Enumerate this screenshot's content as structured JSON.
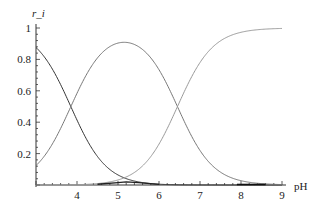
{
  "chart_data": {
    "type": "line",
    "title": "",
    "xlabel": "pH",
    "ylabel": "r_i",
    "xlim": [
      3,
      9
    ],
    "ylim": [
      0,
      1
    ],
    "grid": false,
    "legend": null,
    "x_ticks": [
      "4",
      "5",
      "6",
      "7",
      "8",
      "9"
    ],
    "y_ticks": [
      "0.2",
      "0.4",
      "0.6",
      "0.8",
      "1"
    ],
    "model": {
      "pK1": 3.85,
      "pK2": 6.45
    },
    "series": [
      {
        "name": "r0",
        "x": [
          3,
          3.5,
          3.85,
          4,
          4.5,
          5,
          5.5,
          6,
          6.5,
          7,
          8,
          9
        ],
        "values": [
          0.876,
          0.69,
          0.51,
          0.41,
          0.18,
          0.066,
          0.021,
          0.006,
          0.002,
          0.0005,
          0.0,
          0.0
        ]
      },
      {
        "name": "r1",
        "x": [
          3,
          3.5,
          3.85,
          4,
          4.5,
          5,
          5.15,
          5.5,
          6,
          6.45,
          7,
          7.5,
          8,
          9
        ],
        "values": [
          0.124,
          0.31,
          0.49,
          0.58,
          0.81,
          0.9,
          0.905,
          0.87,
          0.73,
          0.5,
          0.22,
          0.08,
          0.027,
          0.003
        ]
      },
      {
        "name": "r2",
        "x": [
          3,
          4,
          5,
          5.5,
          6,
          6.45,
          7,
          7.5,
          8,
          8.5,
          9
        ],
        "values": [
          0.0,
          0.005,
          0.036,
          0.11,
          0.26,
          0.5,
          0.78,
          0.92,
          0.973,
          0.991,
          0.997
        ]
      },
      {
        "name": "r3",
        "x": [
          4.5,
          5.0,
          5.2,
          5.5,
          6.0
        ],
        "values": [
          0.005,
          0.015,
          0.02,
          0.015,
          0.004
        ]
      }
    ]
  }
}
